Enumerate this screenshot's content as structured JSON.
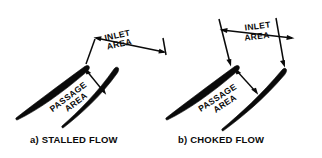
{
  "figure": {
    "width": 322,
    "height": 158,
    "background": "#ffffff",
    "ink_color": "#0a0a0a"
  },
  "panels": [
    {
      "id": "stalled",
      "caption": "a) STALLED FLOW",
      "inlet_label_line1": "INLET",
      "inlet_label_line2": "AREA",
      "passage_label_line1": "PASSAGE",
      "passage_label_line2": "AREA",
      "inlet_dimension_rotation_deg": -12,
      "passage_label_rotation_deg": -37,
      "blades": [
        {
          "name": "blade-upper-left",
          "stagger_deg": -38
        },
        {
          "name": "blade-lower-right",
          "stagger_deg": -58
        }
      ]
    },
    {
      "id": "choked",
      "caption": "b) CHOKED FLOW",
      "inlet_label_line1": "INLET",
      "inlet_label_line2": "AREA",
      "passage_label_line1": "PASSAGE",
      "passage_label_line2": "AREA",
      "inlet_dimension_rotation_deg": -7,
      "passage_label_rotation_deg": -33,
      "blades": [
        {
          "name": "blade-upper-left",
          "stagger_deg": -38
        },
        {
          "name": "blade-lower-right",
          "stagger_deg": -52
        }
      ]
    }
  ],
  "annotations": {
    "inlet_area_name": "INLET AREA",
    "passage_area_name": "PASSAGE AREA"
  }
}
